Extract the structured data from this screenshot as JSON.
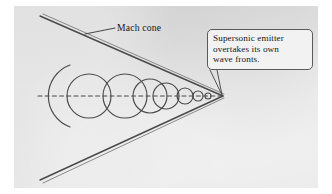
{
  "figure": {
    "title_alt": "Mach cone formed by a supersonic emitter overtaking its own wave fronts",
    "background_color": "#dcdcdc",
    "ink_color": "#4a4a4c",
    "text_color": "#18181a"
  },
  "labels": {
    "mach_cone": "Mach cone"
  },
  "callout": {
    "lines": [
      "Supersonic emitter",
      "overtakes its own",
      "wave fronts."
    ],
    "border_color": "#5a5a5a",
    "fill_color": "#f2f2f2"
  },
  "diagram_data": {
    "type": "geometric-diagram",
    "apex": {
      "x": 222,
      "y": 96
    },
    "axis": {
      "name": "emitter-path",
      "style": "dashed",
      "x1": 38,
      "y1": 96,
      "x2": 220,
      "y2": 96
    },
    "mach_lines": [
      {
        "name": "upper-mach-line",
        "x1": 42,
        "y1": 17,
        "x2": 222,
        "y2": 96
      },
      {
        "name": "lower-mach-line",
        "x1": 42,
        "y1": 178,
        "x2": 222,
        "y2": 96
      }
    ],
    "wave_fronts": [
      {
        "cx": 89,
        "cy": 96,
        "r": 33,
        "partial": true
      },
      {
        "cx": 89,
        "cy": 96,
        "r": 22
      },
      {
        "cx": 125,
        "cy": 96,
        "r": 22
      },
      {
        "cx": 150,
        "cy": 96,
        "r": 17
      },
      {
        "cx": 166,
        "cy": 96,
        "r": 13
      },
      {
        "cx": 185,
        "cy": 96,
        "r": 8
      },
      {
        "cx": 198,
        "cy": 96,
        "r": 5
      },
      {
        "cx": 208,
        "cy": 96,
        "r": 3
      }
    ],
    "leader_line": {
      "name": "mach-cone-leader",
      "x1": 86,
      "y1": 34,
      "x2": 114,
      "y2": 28
    },
    "callout_tail": {
      "from_x": 213,
      "from_y": 72,
      "to_x": 222,
      "to_y": 95
    }
  }
}
